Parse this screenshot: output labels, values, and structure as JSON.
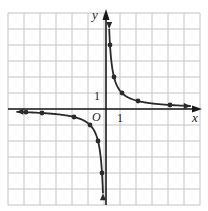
{
  "chart_data": {
    "type": "line",
    "title": "",
    "function": "y = 1/x",
    "xlabel": "x",
    "ylabel": "y",
    "origin_label": "O",
    "x_tick_label": "1",
    "y_tick_label": "1",
    "xlim": [
      -6,
      6
    ],
    "ylim": [
      -6,
      6
    ],
    "grid": true,
    "legend": null,
    "series": [
      {
        "name": "branch-positive",
        "points": [
          [
            0.2,
            5.0
          ],
          [
            0.25,
            4
          ],
          [
            0.5,
            2
          ],
          [
            1,
            1
          ],
          [
            2,
            0.5
          ],
          [
            4,
            0.25
          ],
          [
            5.3,
            0.19
          ]
        ],
        "marked_points": [
          [
            0.25,
            4
          ],
          [
            0.5,
            2
          ],
          [
            1,
            1
          ],
          [
            2,
            0.5
          ],
          [
            4,
            0.25
          ]
        ]
      },
      {
        "name": "branch-negative",
        "points": [
          [
            -5.6,
            -0.18
          ],
          [
            -5,
            -0.2
          ],
          [
            -4,
            -0.25
          ],
          [
            -2,
            -0.5
          ],
          [
            -1,
            -1
          ],
          [
            -0.5,
            -2
          ],
          [
            -0.25,
            -4
          ],
          [
            -0.19,
            -5.2
          ]
        ],
        "marked_points": [
          [
            -5,
            -0.2
          ],
          [
            -4,
            -0.25
          ],
          [
            -2,
            -0.5
          ],
          [
            -1,
            -1
          ],
          [
            -0.5,
            -2
          ],
          [
            -0.25,
            -4
          ]
        ]
      }
    ]
  },
  "colors": {
    "grid": "#c4c4c4",
    "axis": "#1a1a1a",
    "curve": "#2a2a2a"
  }
}
